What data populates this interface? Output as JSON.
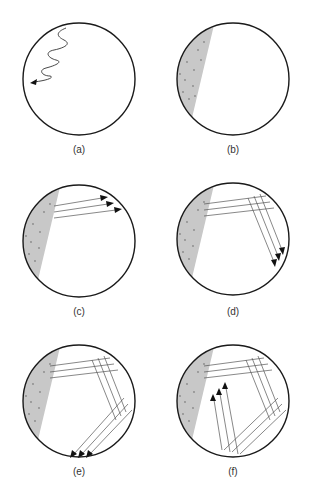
{
  "figure": {
    "colors": {
      "outline": "#1a1a1a",
      "sediment": "#c8c8c8",
      "ray": "#555555",
      "dots": "#888888"
    },
    "panels": [
      {
        "id": "a",
        "label": "(a)",
        "content": "wavy-arrow"
      },
      {
        "id": "b",
        "label": "(b)",
        "content": "sediment-wedge"
      },
      {
        "id": "c",
        "label": "(c)",
        "content": "sediment-wedge + 3 rays to upper right"
      },
      {
        "id": "d",
        "label": "(d)",
        "content": "rays reflect downward"
      },
      {
        "id": "e",
        "label": "(e)",
        "content": "rays reflect to lower left"
      },
      {
        "id": "f",
        "label": "(f)",
        "content": "rays reflect upward"
      }
    ]
  }
}
